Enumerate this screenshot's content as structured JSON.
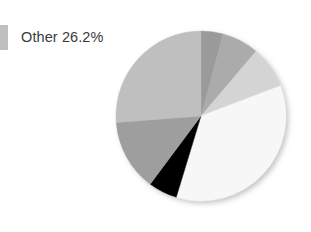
{
  "legend": {
    "entries": [
      {
        "label": "Other 26.2%",
        "swatch_color": "#bfbfbf",
        "icon": "legend-swatch-icon"
      }
    ]
  },
  "chart_data": {
    "type": "pie",
    "title": "",
    "subtitle": "",
    "xlabel": "",
    "ylabel": "",
    "grid": false,
    "legend_position": "left-top",
    "start_angle_deg": -90,
    "direction": "clockwise",
    "center": {
      "x": 207,
      "y": 122
    },
    "radius": 85,
    "labels": [
      "Segment 1",
      "Segment 2",
      "Segment 3",
      "Segment 4",
      "Segment 5",
      "Segment 6",
      "Other"
    ],
    "values": [
      4.2,
      7.0,
      8.0,
      35.5,
      5.5,
      13.6,
      26.2
    ],
    "colors": [
      "#9a9a9a",
      "#ababab",
      "#d4d4d4",
      "#f7f7f7",
      "#000000",
      "#9e9e9e",
      "#bfbfbf"
    ],
    "slices": [
      {
        "label": "Segment 1",
        "value": 4.2,
        "color": "#9a9a9a"
      },
      {
        "label": "Segment 2",
        "value": 7.0,
        "color": "#ababab"
      },
      {
        "label": "Segment 3",
        "value": 8.0,
        "color": "#d4d4d4"
      },
      {
        "label": "Segment 4",
        "value": 35.5,
        "color": "#f7f7f7"
      },
      {
        "label": "Segment 5",
        "value": 5.5,
        "color": "#000000"
      },
      {
        "label": "Segment 6",
        "value": 13.6,
        "color": "#9e9e9e"
      },
      {
        "label": "Other",
        "value": 26.2,
        "color": "#bfbfbf"
      }
    ],
    "annotations": [
      "Other 26.2%"
    ]
  }
}
